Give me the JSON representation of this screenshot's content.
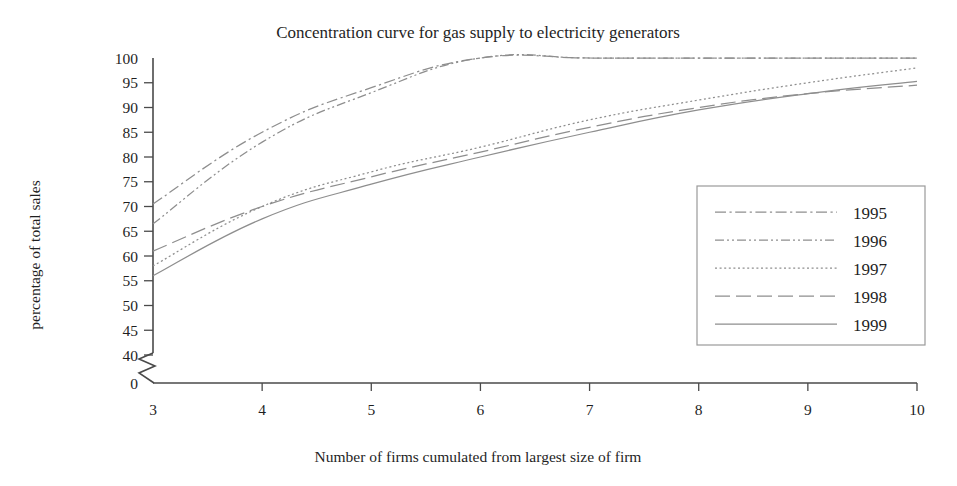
{
  "chart_data": {
    "type": "line",
    "title": "Concentration curve for gas supply to electricity generators",
    "xlabel": "Number of firms cumulated from largest size of firm",
    "ylabel": "percentage of total sales",
    "x": [
      3,
      4,
      5,
      6,
      7,
      8,
      9,
      10
    ],
    "xlim": [
      3,
      10
    ],
    "ylim": [
      40,
      100
    ],
    "y_axis_break": true,
    "y_break_value": 0,
    "xticks": [
      "3",
      "4",
      "5",
      "6",
      "7",
      "8",
      "9",
      "10"
    ],
    "yticks": [
      "100",
      "95",
      "90",
      "85",
      "80",
      "75",
      "70",
      "65",
      "60",
      "55",
      "50",
      "45",
      "40",
      "0"
    ],
    "grid": false,
    "legend_position": "right-middle",
    "series": [
      {
        "name": "1995",
        "style": "dash-dot",
        "dasharray": "11,3.5,2.2,3.5",
        "values": [
          70.5,
          85.0,
          94.0,
          100.0,
          100.0,
          100.0,
          100.0,
          100.0
        ]
      },
      {
        "name": "1996",
        "style": "dash-dot-dot",
        "dasharray": "9,3,2,3,2,3",
        "values": [
          66.5,
          83.0,
          93.0,
          100.0,
          100.0,
          100.0,
          100.0,
          100.0
        ]
      },
      {
        "name": "1997",
        "style": "dotted",
        "dasharray": "2,2.6",
        "values": [
          58.0,
          70.0,
          77.0,
          82.0,
          87.5,
          91.5,
          95.0,
          98.0
        ]
      },
      {
        "name": "1998",
        "style": "long-dash",
        "dasharray": "15,6",
        "values": [
          61.0,
          70.0,
          76.0,
          81.0,
          86.0,
          90.0,
          92.8,
          94.5
        ]
      },
      {
        "name": "1999",
        "style": "solid",
        "dasharray": "none",
        "values": [
          56.0,
          67.5,
          74.5,
          80.0,
          85.0,
          89.5,
          92.8,
          95.3
        ]
      }
    ]
  },
  "colors": {
    "line": "#8e8e8e",
    "axis": "#4a4a4a",
    "text": "#1f1f1f",
    "background": "#ffffff"
  }
}
